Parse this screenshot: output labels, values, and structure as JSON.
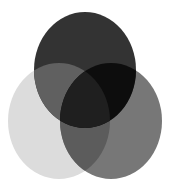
{
  "diagram": {
    "type": "venn-3",
    "background": "#ffffff",
    "canvas": {
      "width": 171,
      "height": 188
    },
    "sets": [
      {
        "id": "top",
        "cx": 85,
        "cy": 70,
        "rx": 51,
        "ry": 58,
        "fill": "#333333"
      },
      {
        "id": "left",
        "cx": 59,
        "cy": 121,
        "rx": 51,
        "ry": 58,
        "fill": "#dcdcdc"
      },
      {
        "id": "right",
        "cx": 111,
        "cy": 121,
        "rx": 51,
        "ry": 58,
        "fill": "#777777"
      }
    ],
    "regions": {
      "top_only": "#333333",
      "left_only": "#dcdcdc",
      "right_only": "#777777",
      "top_left": "#606060",
      "top_right": "#0d0d0d",
      "left_right": "#5c5c5c",
      "center_all": "#1f1f1f"
    }
  }
}
